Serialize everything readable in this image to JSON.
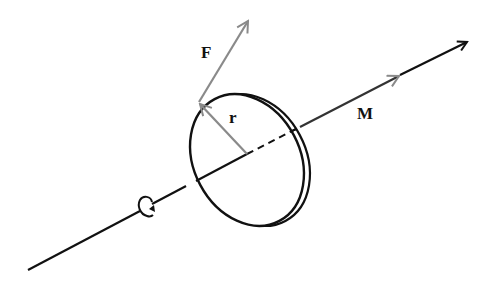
{
  "diagram": {
    "labels": {
      "force": "F",
      "radius": "r",
      "moment": "M"
    },
    "colors": {
      "axis": "#111111",
      "vector": "#8a8a8a",
      "disc": "#111111",
      "text": "#111111"
    },
    "elements": [
      {
        "name": "rotation-axis",
        "description": "axis of rotation through disc center"
      },
      {
        "name": "disc",
        "description": "thin circular disc seen in perspective"
      },
      {
        "name": "force-vector",
        "label": "F"
      },
      {
        "name": "radius-vector",
        "label": "r"
      },
      {
        "name": "moment-vector",
        "label": "M"
      },
      {
        "name": "rotation-direction-symbol",
        "description": "curled arrow indicating sense of rotation"
      }
    ]
  }
}
